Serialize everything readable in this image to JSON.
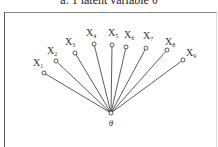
{
  "title": "a. 1 latent variable θ",
  "latent": {
    "label": "θ",
    "x": 111,
    "y": 113,
    "label_y": 126
  },
  "observed": [
    {
      "name": "X",
      "sub": "1",
      "nx": 44,
      "ny": 73,
      "lx": 33,
      "ly": 66
    },
    {
      "name": "X",
      "sub": "2",
      "nx": 56,
      "ny": 61,
      "lx": 47,
      "ly": 54
    },
    {
      "name": "X",
      "sub": "3",
      "nx": 75,
      "ny": 53,
      "lx": 65,
      "ly": 45
    },
    {
      "name": "X",
      "sub": "4",
      "nx": 94,
      "ny": 44,
      "lx": 86,
      "ly": 36
    },
    {
      "name": "X",
      "sub": "5",
      "nx": 112,
      "ny": 45,
      "lx": 108,
      "ly": 36
    },
    {
      "name": "X",
      "sub": "6",
      "nx": 126,
      "ny": 47,
      "lx": 124,
      "ly": 38
    },
    {
      "name": "X",
      "sub": "7",
      "nx": 146,
      "ny": 48,
      "lx": 143,
      "ly": 39
    },
    {
      "name": "X",
      "sub": "8",
      "nx": 167,
      "ny": 50,
      "lx": 165,
      "ly": 45
    },
    {
      "name": "X",
      "sub": "9",
      "nx": 183,
      "ny": 60,
      "lx": 186,
      "ly": 56
    }
  ],
  "colors": {
    "stroke": "#333333",
    "node_fill": "#ffffff"
  }
}
